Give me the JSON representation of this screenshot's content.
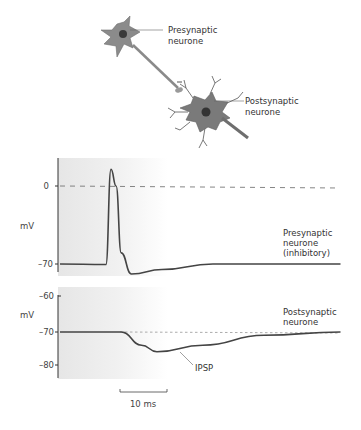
{
  "diagram": {
    "labels": {
      "presynaptic_line1": "Presynaptic",
      "presynaptic_line2": "neurone",
      "postsynaptic_line1": "Postsynaptic",
      "postsynaptic_line2": "neurone"
    }
  },
  "chart_data": [
    {
      "type": "line",
      "title": "",
      "ylabel": "mV",
      "xlabel": "",
      "y_ticks": [
        "0",
        "–70"
      ],
      "ylim": [
        -80,
        20
      ],
      "reference_line": {
        "value": 0,
        "style": "dashed"
      },
      "series": [
        {
          "name": "Presynaptic neurone (inhibitory)",
          "label_lines": [
            "Presynaptic",
            "neurone",
            "(inhibitory)"
          ],
          "points_ms_mV": [
            [
              0,
              -70
            ],
            [
              9,
              -70.5
            ],
            [
              10,
              15
            ],
            [
              11,
              0
            ],
            [
              12,
              -60
            ],
            [
              14,
              -79
            ],
            [
              20,
              -75
            ],
            [
              30,
              -70
            ],
            [
              55,
              -70
            ]
          ]
        }
      ]
    },
    {
      "type": "line",
      "title": "",
      "ylabel": "mV",
      "xlabel": "",
      "y_ticks": [
        "–60",
        "–70",
        "–80"
      ],
      "ylim": [
        -84,
        -60
      ],
      "reference_line": {
        "value": -70,
        "style": "dotted"
      },
      "series": [
        {
          "name": "Postsynaptic neurone",
          "label_lines": [
            "Postsynaptic",
            "neurone"
          ],
          "points_ms_mV": [
            [
              0,
              -70
            ],
            [
              12,
              -70
            ],
            [
              16,
              -74
            ],
            [
              19,
              -76
            ],
            [
              28,
              -74
            ],
            [
              40,
              -71
            ],
            [
              55,
              -70
            ]
          ]
        }
      ],
      "annotation": "IPSP"
    }
  ],
  "scale_bar": {
    "label": "10 ms"
  }
}
